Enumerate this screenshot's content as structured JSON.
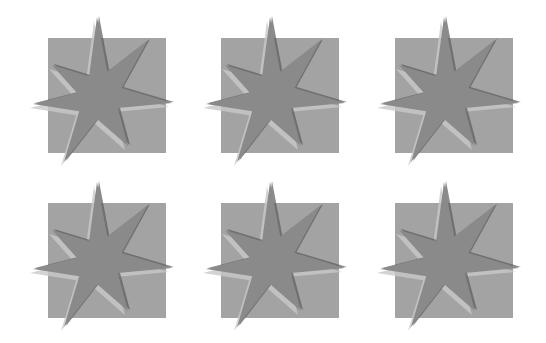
{
  "grid": {
    "rows": 2,
    "cols": 3,
    "tiles": [
      {
        "x": 48,
        "y": 38
      },
      {
        "x": 221,
        "y": 38
      },
      {
        "x": 395,
        "y": 38
      },
      {
        "x": 48,
        "y": 203
      },
      {
        "x": 221,
        "y": 203
      },
      {
        "x": 395,
        "y": 203
      }
    ]
  },
  "tile_style": {
    "square_color": "#a3a3a3",
    "star_color": "#8a8a8a",
    "ghost_light": "#c8c8c8",
    "ghost_dark": "#5a5a5a",
    "square_width": 118,
    "square_height": 115
  }
}
